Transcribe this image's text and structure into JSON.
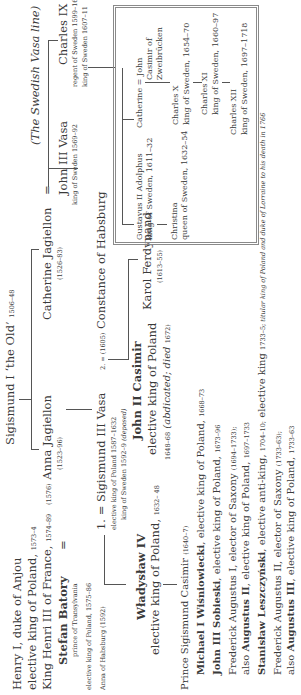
{
  "root": {
    "name": "Sigismund I ‘the Old’",
    "dates": "1506–48"
  },
  "left_column": {
    "henry": {
      "name": "Henry I, duke of Anjou",
      "line2": "elective king of Poland,",
      "line2_dates": "1573–4",
      "line3": "King Henri III of France,",
      "line3_dates": "1574–89"
    },
    "stefan": {
      "name": "Stefan Batory",
      "eq": "=",
      "title1": "prince of Transylvania",
      "title2": "elective king of Poland, 1575–86"
    },
    "anna_habsburg": "Anna of Habsburg (1592)",
    "wladyslaw": {
      "name": "Władysław IV",
      "title": "elective king of Poland,",
      "dates": "1632– 48"
    }
  },
  "children": {
    "anna": {
      "marriage": "(1576)",
      "name": "Anna Jagiellon",
      "dates": "(1523–96)"
    },
    "catherine": {
      "name": "Catherine Jagiellon",
      "eq": "=",
      "dates": "(1526–83)"
    }
  },
  "sigismund3": {
    "prefix": "1. =",
    "name": "Sigismund III Vasa",
    "line1": "elective king of Poland 1587–1632",
    "line2": "king of Sweden 1592–9",
    "line2_italic": "(deposed)",
    "marriage2_prefix": "2. = (1605)",
    "marriage2_name": "Constance of Habsburg"
  },
  "john_casimir": {
    "name": "John II Casimir",
    "title": "elective king of Poland",
    "dates": "1648–68",
    "note": "(abdicated; died",
    "note_year": "1672)"
  },
  "karol": {
    "name": "Karol Ferdynand",
    "dates": "(1613–55)"
  },
  "prince_sigismund": {
    "name": "Prince Sigismund Casimir",
    "dates": "(1640–7)"
  },
  "elected_kings": [
    {
      "bold": "Michael I Wiśniowiecki",
      "rest": ", elective king of Poland,",
      "dates": "1668–73"
    },
    {
      "bold": "John III Sobieski",
      "rest": ", elective king of Poland,",
      "dates": "1673–96"
    },
    {
      "pre": "Frederick Augustus I, elector of Saxony",
      "pre_dates": "(1694–1733);",
      "bold_prefix": "also ",
      "bold": "Augustus II",
      "rest": ", elective king of Poland,",
      "dates": "1697–1733"
    },
    {
      "bold": "Stanisław Leszczyński",
      "rest": ", elective anti-king,",
      "dates": "1704–10;",
      "rest2": " elective king",
      "dates2": "1733–5;",
      "italic": " titular king of Poland and duke of Lorraine to his death in 1766"
    },
    {
      "pre": "Frederick Augustus II, elector of Saxony",
      "pre_dates": "(1733–63);",
      "bold_prefix": "also ",
      "bold": "Augustus III",
      "rest": ", elective king of Poland,",
      "dates": "1733–63"
    }
  ],
  "swedish": {
    "header": "(The Swedish Vasa line)",
    "john3": {
      "name": "John III Vasa",
      "title": "king of Sweden 1569–92"
    },
    "charles9": {
      "name": "Charles IX",
      "title1": "regent of Sweden 1599–1607",
      "title2": "king of Sweden 1607–11"
    },
    "box": {
      "gustavus": {
        "name": "Gustavus II Adolphus",
        "title": "king of Sweden, 1611–32"
      },
      "christina": {
        "name": "Christina",
        "title": "queen of Sweden, 1632–54"
      },
      "catherine": {
        "name": "Catherine = John",
        "spouse2": "Casimir of",
        "spouse3": "Zweibrücken"
      },
      "charles10": {
        "name": "Charles X",
        "title": "king of Sweden, 1654–70"
      },
      "charles11": {
        "name": "Charles XI",
        "title": "king of Sweden, 1660–97"
      },
      "charles12": {
        "name": "Charles XII",
        "title": "king of Sweden, 1697–1718"
      }
    }
  }
}
